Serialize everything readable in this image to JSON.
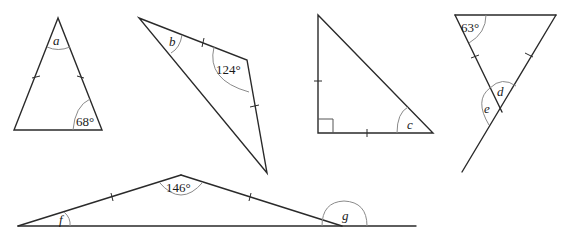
{
  "figures": [
    {
      "id": "isosceles-a",
      "labels": {
        "unknown": "a",
        "given": "68°"
      }
    },
    {
      "id": "isosceles-b",
      "labels": {
        "unknown": "b",
        "given": "124°"
      }
    },
    {
      "id": "right-isosceles-c",
      "labels": {
        "unknown": "c"
      }
    },
    {
      "id": "isosceles-de",
      "labels": {
        "given": "63°",
        "unknown_1": "d",
        "unknown_2": "e"
      }
    },
    {
      "id": "isosceles-fg",
      "labels": {
        "given": "146°",
        "unknown_1": "f",
        "unknown_2": "g"
      }
    }
  ],
  "colors": {
    "line": "#2a2a2a",
    "arc": "#8a8a8a",
    "text": "#1a1a1a",
    "background": "#ffffff"
  }
}
